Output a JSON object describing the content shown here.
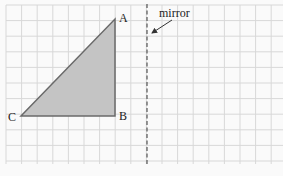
{
  "diagram": {
    "type": "reflection-grid",
    "grid": {
      "x_lines": [
        6,
        21.6,
        37.2,
        52.8,
        68.4,
        84,
        99.6,
        115.2,
        130.8,
        146.4,
        162,
        177.6,
        193.2,
        208.8,
        224.4,
        240,
        255.6,
        271.2
      ],
      "y_lines": [
        5,
        20.6,
        36.2,
        51.8,
        67.4,
        83,
        98.6,
        114.2,
        129.8,
        145.4,
        161
      ],
      "x_start": 6,
      "x_end": 283,
      "y_start": 5,
      "y_end": 164,
      "line_color": "#d8d8d8",
      "background": "#fafafa"
    },
    "triangle": {
      "fill": "#c4c4c4",
      "stroke": "#6a6a6a",
      "vertices": {
        "A": {
          "x": 115,
          "y": 19
        },
        "B": {
          "x": 115,
          "y": 116
        },
        "C": {
          "x": 21,
          "y": 116
        }
      }
    },
    "labels": {
      "A": "A",
      "B": "B",
      "C": "C",
      "mirror": "mirror"
    },
    "mirror_line": {
      "x": 147,
      "y1": 4,
      "y2": 165,
      "color": "#555555"
    },
    "arrow": {
      "x1": 172,
      "y1": 20,
      "x2": 152,
      "y2": 33,
      "color": "#333333"
    }
  }
}
